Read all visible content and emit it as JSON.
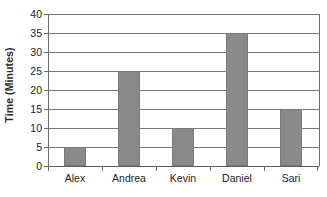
{
  "chart_data": {
    "type": "bar",
    "title": "",
    "xlabel": "",
    "ylabel": "Time (Minutes)",
    "categories": [
      "Alex",
      "Andrea",
      "Kevin",
      "Daniel",
      "Sari"
    ],
    "values": [
      5,
      25,
      10,
      35,
      15
    ],
    "ylim": [
      0,
      40
    ],
    "ytick_step": 5,
    "ytick_labels": [
      "0",
      "5",
      "10",
      "15",
      "20",
      "25",
      "30",
      "35",
      "40"
    ],
    "grid": "horizontal",
    "legend": "none",
    "bar_color": "#8a8a8a",
    "axis_color": "#6e6e6e",
    "gridline_color": "#777777",
    "background": "#ffffff"
  }
}
